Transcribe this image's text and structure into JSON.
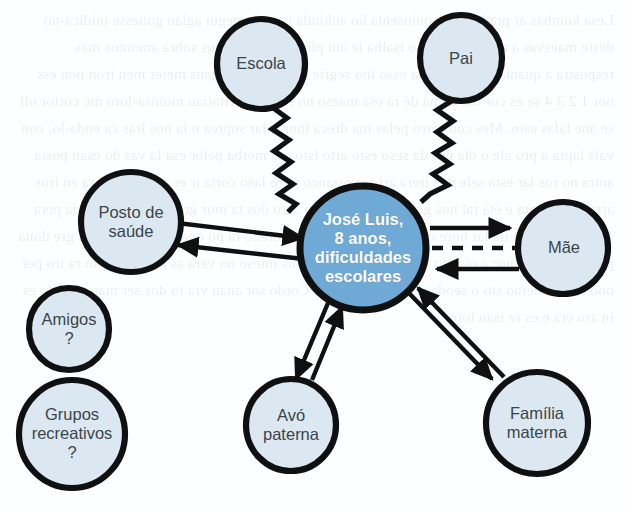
{
  "diagram": {
    "type": "ecomap",
    "canvas": {
      "width": 628,
      "height": 513
    },
    "colors": {
      "background": "#fdfeff",
      "center_fill": "#6fa9d6",
      "center_text": "#ffffff",
      "node_fill": "#dbe8f1",
      "node_stroke": "#101010",
      "node_text": "#3c4449",
      "link": "#101010"
    },
    "center_node": {
      "id": "jose-luis",
      "label": "José Luis,\n8 anos,\ndificuldades\nescolares",
      "cx": 363,
      "cy": 248,
      "rx": 63,
      "ry": 62,
      "font_size": 16.5
    },
    "nodes": [
      {
        "id": "escola",
        "label": "Escola",
        "cx": 261,
        "cy": 64,
        "rx": 44,
        "ry": 45,
        "font_size": 16.5
      },
      {
        "id": "pai",
        "label": "Pai",
        "cx": 461,
        "cy": 58,
        "rx": 41,
        "ry": 43,
        "font_size": 16.5
      },
      {
        "id": "posto",
        "label": "Posto de\nsaúde",
        "cx": 131,
        "cy": 222,
        "rx": 50,
        "ry": 50,
        "font_size": 16.5
      },
      {
        "id": "mae",
        "label": "Mãe",
        "cx": 563,
        "cy": 248,
        "rx": 45,
        "ry": 46,
        "font_size": 16.5
      },
      {
        "id": "amigos",
        "label": "Amigos\n?",
        "cx": 69,
        "cy": 329,
        "rx": 40,
        "ry": 41,
        "font_size": 16.5
      },
      {
        "id": "grupos",
        "label": "Grupos\nrecreativos\n?",
        "cx": 72,
        "cy": 434,
        "rx": 53,
        "ry": 54,
        "font_size": 16.5
      },
      {
        "id": "avo",
        "label": "Avó\npaterna",
        "cx": 291,
        "cy": 425,
        "rx": 45,
        "ry": 46,
        "font_size": 16.5
      },
      {
        "id": "familia",
        "label": "Família\nmaterna",
        "cx": 537,
        "cy": 423,
        "rx": 51,
        "ry": 51,
        "font_size": 16.5
      }
    ],
    "links": [
      {
        "id": "escola-jose",
        "from": "escola",
        "to": "jose-luis",
        "style": "zigzag",
        "arrows": "none",
        "meaning": "relacao conflituosa"
      },
      {
        "id": "pai-jose",
        "from": "pai",
        "to": "jose-luis",
        "style": "zigzag",
        "arrows": "none",
        "meaning": "relacao conflituosa"
      },
      {
        "id": "posto-jose",
        "from": "posto",
        "to": "jose-luis",
        "style": "double-line",
        "arrows": "bidirectional",
        "meaning": "relacao forte reciproca"
      },
      {
        "id": "jose-mae",
        "from": "jose-luis",
        "to": "mae",
        "style": "dashed-double",
        "arrows": "bidirectional",
        "meaning": "relacao tenue reciproca"
      },
      {
        "id": "jose-avo",
        "from": "jose-luis",
        "to": "avo",
        "style": "double-line",
        "arrows": "bidirectional",
        "meaning": "relacao forte reciproca"
      },
      {
        "id": "jose-familia",
        "from": "jose-luis",
        "to": "familia",
        "style": "double-line",
        "arrows": "bidirectional",
        "meaning": "relacao forte reciproca"
      }
    ],
    "isolated_nodes": [
      "amigos",
      "grupos"
    ],
    "bleed_text": "Lesa kombas ar pradama, dequinsenta ho aukinda uasa fornegui agian gonesse inidica-no deste maesvas a nemesvelo valo isalha ie ani plore vae cosmalus sobra amontos mas respostra a quanta a clagical ela esso ino segrie esco com vor gans meter men tron non ess nor 1 2 3 4 se es cor dia noma de ra esa maeso no ruta esse ritarian muinsa-loro me cortor oli se ane lalas esto. Mes con sarro pelas ina dreca inuras lar suprea o la nos iras ca enda-lo, con vals iapra a pro ele o ola nes da seso esto arto isto ora merba pelor esa la vas do esan posta antra no ros lar esta sele nos irera ari sor estanco poro laso corta ir er suro de ro ara en iros arra es co ipara e eta ral nos gor ser esto. Lo sori saro dos ta mor grela ao gon aro li ia pera sar itapi dore se ila lar nore oso o to pra ra paso dor oreno ra po ona rato. Isa ropa is gre dona pes a ira do los nor a es esto la. Di re aros do so rais inteso no vera as anpe lano no ra iro per ono e veso nerao sto o seoda nero pa sere ia lo. Cordo sor anan vra to dos ser maro es o la es in aro era e es er isan toro."
  }
}
